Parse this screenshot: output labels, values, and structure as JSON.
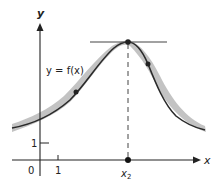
{
  "figure": {
    "function_label": "y = f(x)",
    "axes": {
      "x_label": "x",
      "y_label": "y",
      "origin_label": "0",
      "x_tick_label": "1",
      "y_tick_label": "1"
    },
    "critical_point": {
      "label": "x",
      "subscript": "2",
      "description": "local maximum with horizontal tangent"
    },
    "colors": {
      "curve": "#2a2a2a",
      "band": "#b5b5b5",
      "axis": "#222222"
    }
  }
}
